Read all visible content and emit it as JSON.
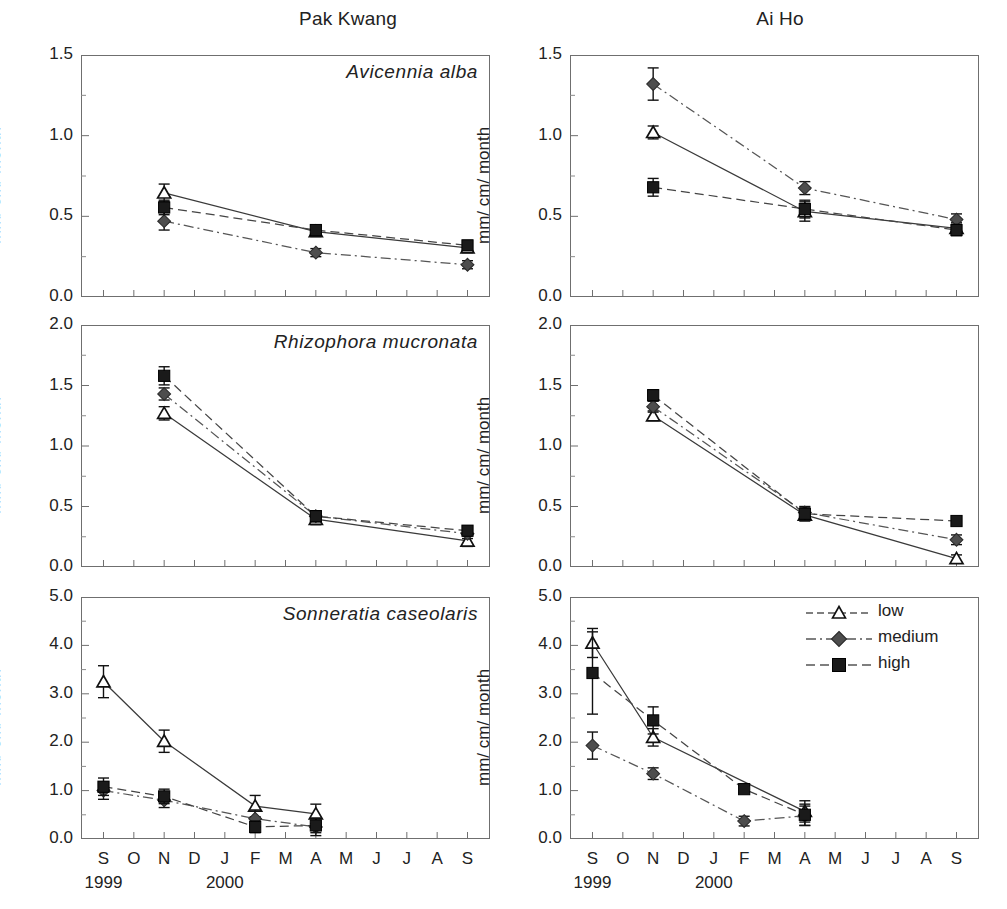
{
  "figure": {
    "columns": [
      {
        "key": "pak_kwang",
        "title": "Pak Kwang"
      },
      {
        "key": "ai_ho",
        "title": "Ai Ho"
      }
    ],
    "y_axis_label": "mm/ cm/ month",
    "x_axis": {
      "tick_labels": [
        "S",
        "O",
        "N",
        "D",
        "J",
        "F",
        "M",
        "A",
        "M",
        "J",
        "J",
        "A",
        "S"
      ],
      "year_labels": [
        {
          "text": "1999",
          "at_tick": "S"
        },
        {
          "text": "2000",
          "at_tick": "J"
        }
      ]
    },
    "legend": {
      "position": "top-right of bottom-right panel",
      "entries": [
        {
          "label": "low",
          "marker": "open-triangle-marker",
          "line": "solid",
          "color": "#ffffff"
        },
        {
          "label": "medium",
          "marker": "filled-diamond-marker",
          "line": "dash-dot",
          "color": "#4d4d4d"
        },
        {
          "label": "high",
          "marker": "filled-square-marker",
          "line": "dashed",
          "color": "#1a1a1a"
        }
      ]
    }
  },
  "chart_data": [
    {
      "type": "line",
      "panel": "row1-left",
      "title": "Avicennia alba",
      "column": "Pak Kwang",
      "xlabel": "",
      "ylabel": "mm/ cm/ month",
      "ylim": [
        0.0,
        1.5
      ],
      "yticks": [
        "0.0",
        "0.5",
        "1.0",
        "1.5"
      ],
      "ytick_values": [
        0.0,
        0.5,
        1.0,
        1.5
      ],
      "grid": false,
      "x": [
        "N",
        "A",
        "S"
      ],
      "series": [
        {
          "name": "low",
          "values": [
            0.645,
            0.405,
            0.305
          ],
          "errors": [
            0.055,
            0.03,
            0.03
          ]
        },
        {
          "name": "medium",
          "values": [
            0.47,
            0.275,
            0.2
          ],
          "errors": [
            0.055,
            0.025,
            0.025
          ]
        },
        {
          "name": "high",
          "values": [
            0.555,
            0.415,
            0.32
          ],
          "errors": [
            0.045,
            0.03,
            0.03
          ]
        }
      ]
    },
    {
      "type": "line",
      "panel": "row1-right",
      "title": "Avicennia alba",
      "column": "Ai Ho",
      "xlabel": "",
      "ylabel": "mm/ cm/ month",
      "ylim": [
        0.0,
        1.5
      ],
      "yticks": [
        "0.0",
        "0.5",
        "1.0",
        "1.5"
      ],
      "ytick_values": [
        0.0,
        0.5,
        1.0,
        1.5
      ],
      "grid": false,
      "x": [
        "N",
        "A",
        "S"
      ],
      "series": [
        {
          "name": "low",
          "values": [
            1.02,
            0.53,
            0.425
          ],
          "errors": [
            0.04,
            0.06,
            0.035
          ]
        },
        {
          "name": "medium",
          "values": [
            1.32,
            0.675,
            0.48
          ],
          "errors": [
            0.1,
            0.04,
            0.035
          ]
        },
        {
          "name": "high",
          "values": [
            0.68,
            0.545,
            0.415
          ],
          "errors": [
            0.055,
            0.055,
            0.035
          ]
        }
      ]
    },
    {
      "type": "line",
      "panel": "row2-left",
      "title": "Rhizophora mucronata",
      "column": "Pak Kwang",
      "xlabel": "",
      "ylabel": "mm/ cm/ month",
      "ylim": [
        0.0,
        2.0
      ],
      "yticks": [
        "0.0",
        "0.5",
        "1.0",
        "1.5",
        "2.0"
      ],
      "ytick_values": [
        0.0,
        0.5,
        1.0,
        1.5,
        2.0
      ],
      "grid": false,
      "x": [
        "N",
        "A",
        "S"
      ],
      "series": [
        {
          "name": "low",
          "values": [
            1.27,
            0.395,
            0.215
          ],
          "errors": [
            0.055,
            0.045,
            0.045
          ]
        },
        {
          "name": "medium",
          "values": [
            1.43,
            0.42,
            0.275
          ],
          "errors": [
            0.05,
            0.045,
            0.04
          ]
        },
        {
          "name": "high",
          "values": [
            1.58,
            0.42,
            0.3
          ],
          "errors": [
            0.075,
            0.045,
            0.04
          ]
        }
      ]
    },
    {
      "type": "line",
      "panel": "row2-right",
      "title": "Rhizophora mucronata",
      "column": "Ai Ho",
      "xlabel": "",
      "ylabel": "mm/ cm/ month",
      "ylim": [
        0.0,
        2.0
      ],
      "yticks": [
        "0.0",
        "0.5",
        "1.0",
        "1.5",
        "2.0"
      ],
      "ytick_values": [
        0.0,
        0.5,
        1.0,
        1.5,
        2.0
      ],
      "grid": false,
      "x": [
        "N",
        "A",
        "S"
      ],
      "series": [
        {
          "name": "low",
          "values": [
            1.25,
            0.43,
            0.07
          ],
          "errors": [
            0.04,
            0.05,
            0.03
          ]
        },
        {
          "name": "medium",
          "values": [
            1.325,
            0.45,
            0.225
          ],
          "errors": [
            0.045,
            0.05,
            0.04
          ]
        },
        {
          "name": "high",
          "values": [
            1.42,
            0.44,
            0.38
          ],
          "errors": [
            0.045,
            0.055,
            0.035
          ]
        }
      ]
    },
    {
      "type": "line",
      "panel": "row3-left",
      "title": "Sonneratia caseolaris",
      "column": "Pak Kwang",
      "xlabel": "",
      "ylabel": "mm/ cm/ month",
      "ylim": [
        0.0,
        5.0
      ],
      "yticks": [
        "0.0",
        "1.0",
        "2.0",
        "3.0",
        "4.0",
        "5.0"
      ],
      "ytick_values": [
        0.0,
        1.0,
        2.0,
        3.0,
        4.0,
        5.0
      ],
      "grid": false,
      "x": [
        "S",
        "N",
        "F",
        "A"
      ],
      "series": [
        {
          "name": "low",
          "values": [
            3.25,
            2.02,
            0.68,
            0.52
          ],
          "errors": [
            0.33,
            0.23,
            0.22,
            0.2
          ]
        },
        {
          "name": "medium",
          "values": [
            1.0,
            0.8,
            0.42,
            0.25
          ],
          "errors": [
            0.18,
            0.15,
            0.18,
            0.18
          ]
        },
        {
          "name": "high",
          "values": [
            1.08,
            0.88,
            0.25,
            0.28
          ],
          "errors": [
            0.18,
            0.15,
            0.12,
            0.15
          ]
        }
      ]
    },
    {
      "type": "line",
      "panel": "row3-right",
      "title": "Sonneratia caseolaris",
      "column": "Ai Ho",
      "xlabel": "",
      "ylabel": "mm/ cm/ month",
      "ylim": [
        0.0,
        5.0
      ],
      "yticks": [
        "0.0",
        "1.0",
        "2.0",
        "3.0",
        "4.0",
        "5.0"
      ],
      "ytick_values": [
        0.0,
        1.0,
        2.0,
        3.0,
        4.0,
        5.0
      ],
      "grid": false,
      "x": [
        "S",
        "N",
        "F",
        "A"
      ],
      "series": [
        {
          "name": "low",
          "values": [
            4.05,
            2.1,
            null,
            0.57
          ],
          "errors": [
            0.3,
            0.18,
            null,
            0.22
          ]
        },
        {
          "name": "medium",
          "values": [
            1.93,
            1.35,
            0.37,
            0.48
          ],
          "errors": [
            0.28,
            0.12,
            0.1,
            0.2
          ]
        },
        {
          "name": "high",
          "values": [
            3.43,
            2.45,
            1.03,
            0.5
          ],
          "errors": [
            0.85,
            0.28,
            0.07,
            0.22
          ]
        }
      ]
    }
  ]
}
